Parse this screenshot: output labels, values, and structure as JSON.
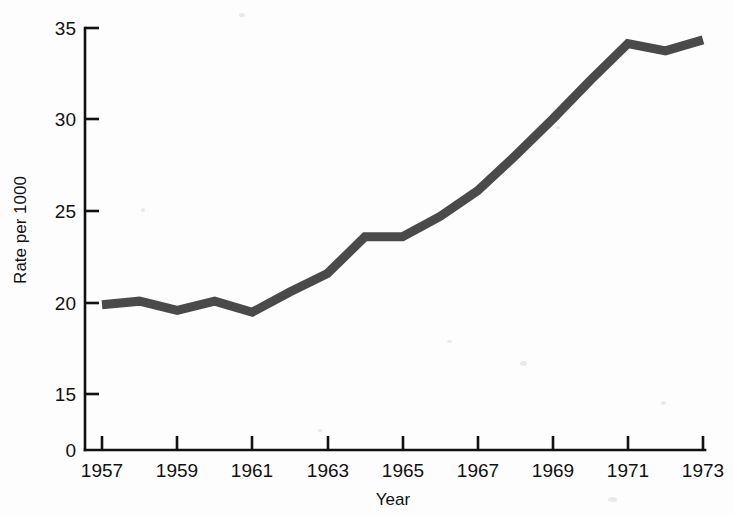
{
  "chart_data": {
    "type": "line",
    "title": "",
    "xlabel": "Year",
    "ylabel": "Rate per 1000",
    "x": [
      1957,
      1958,
      1959,
      1960,
      1961,
      1962,
      1963,
      1964,
      1965,
      1966,
      1967,
      1968,
      1969,
      1970,
      1971,
      1972,
      1973
    ],
    "values": [
      19.9,
      20.1,
      19.6,
      20.1,
      19.5,
      20.6,
      21.6,
      23.6,
      23.6,
      24.7,
      26.1,
      28.0,
      30.0,
      32.1,
      34.1,
      33.7,
      34.3
    ],
    "series": [
      {
        "name": "Rate per 1000",
        "values": [
          19.9,
          20.1,
          19.6,
          20.1,
          19.5,
          20.6,
          21.6,
          23.6,
          23.6,
          24.7,
          26.1,
          28.0,
          30.0,
          32.1,
          34.1,
          33.7,
          34.3
        ]
      }
    ],
    "xlim": [
      1957,
      1973
    ],
    "ylim": [
      15,
      35
    ],
    "y_axis_break_at_zero": true,
    "y_ticks": [
      15,
      20,
      25,
      30,
      35
    ],
    "y_tick_labels": [
      "15",
      "20",
      "25",
      "30",
      "35"
    ],
    "y_origin_label": "0",
    "x_ticks": [
      1957,
      1958,
      1959,
      1960,
      1961,
      1962,
      1963,
      1964,
      1965,
      1966,
      1967,
      1968,
      1969,
      1970,
      1971,
      1972,
      1973
    ],
    "x_tick_labels_shown": [
      "1957",
      "1959",
      "1961",
      "1963",
      "1965",
      "1967",
      "1969",
      "1971",
      "1973"
    ],
    "x_tick_labels_shown_years": [
      1957,
      1959,
      1961,
      1963,
      1965,
      1967,
      1969,
      1971,
      1973
    ],
    "grid": false,
    "legend": false,
    "legend_position": "none",
    "line_color": "#4a4a4a",
    "line_width_px": 9,
    "axis_color": "#111111",
    "background_color": "#fdfdfd"
  }
}
